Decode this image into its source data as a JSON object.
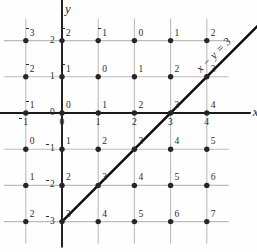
{
  "chart_data": {
    "type": "scatter",
    "title": "",
    "xlabel": "x",
    "ylabel": "y",
    "grid": true,
    "legend": null,
    "xlim": [
      -1,
      4
    ],
    "ylim": [
      -3,
      2
    ],
    "x_ticks": [
      "-1",
      "0",
      "1",
      "2",
      "3",
      "4"
    ],
    "y_ticks": [
      "2",
      "1",
      "0",
      "-1",
      "-2",
      "-3"
    ],
    "x_tick_values": [
      -1,
      0,
      1,
      2,
      3,
      4
    ],
    "y_tick_values": [
      2,
      1,
      0,
      -1,
      -2,
      -3
    ],
    "point_label_meaning": "value of x minus y at each lattice point",
    "rows": [
      {
        "y": 2,
        "labels": [
          "-3",
          "-2",
          "-1",
          "0",
          "1",
          "2"
        ]
      },
      {
        "y": 1,
        "labels": [
          "-2",
          "-1",
          "0",
          "1",
          "2",
          "3"
        ]
      },
      {
        "y": 0,
        "labels": [
          "-1",
          "0",
          "1",
          "2",
          "3",
          "4"
        ]
      },
      {
        "y": -1,
        "labels": [
          "0",
          "1",
          "2",
          "3",
          "4",
          "5"
        ]
      },
      {
        "y": -2,
        "labels": [
          "1",
          "2",
          "3",
          "4",
          "5",
          "6"
        ]
      },
      {
        "y": -3,
        "labels": [
          "2",
          "3",
          "4",
          "5",
          "6",
          "7"
        ]
      }
    ],
    "annotations": [
      {
        "text": "x − y = 3",
        "kind": "line-equation",
        "rotation_deg": -45,
        "passes_through": [
          [
            0,
            -3
          ],
          [
            1,
            -2
          ],
          [
            2,
            -1
          ],
          [
            3,
            0
          ],
          [
            4,
            1
          ]
        ]
      }
    ],
    "line": {
      "equation": "x - y = 3",
      "slope": 1,
      "y_intercept": -3,
      "start": [
        0,
        -3
      ],
      "end": [
        4,
        1
      ]
    },
    "colors": {
      "grid": "#bcbcbc",
      "axis": "#1a1a1a",
      "point": "#262626",
      "line": "#0d0d0d",
      "text": "#2b2b2b",
      "background": "#fefefe"
    }
  },
  "axis_labels": {
    "x": "x",
    "y": "y"
  },
  "line_label": {
    "lhs_x": "x",
    "minus": "−",
    "lhs_y": "y",
    "eq": "=",
    "rhs": "3"
  }
}
